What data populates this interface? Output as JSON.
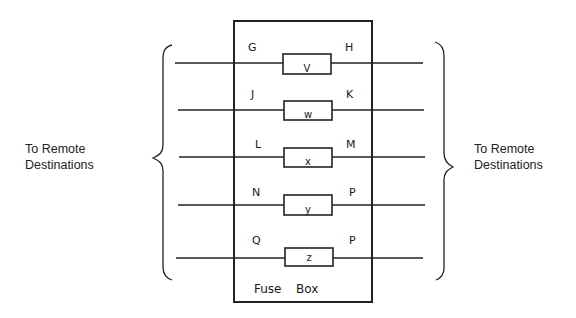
{
  "diagram": {
    "title_words": [
      "Fuse",
      "Box"
    ],
    "left_caption": [
      "To Remote",
      "Destinations"
    ],
    "right_caption": [
      "To Remote",
      "Destinations"
    ],
    "circuits": [
      {
        "left": "G",
        "fuse": "V",
        "right": "H"
      },
      {
        "left": "J",
        "fuse": "w",
        "right": "K"
      },
      {
        "left": "L",
        "fuse": "x",
        "right": "M"
      },
      {
        "left": "N",
        "fuse": "y",
        "right": "P"
      },
      {
        "left": "Q",
        "fuse": "z",
        "right": "P"
      }
    ]
  }
}
